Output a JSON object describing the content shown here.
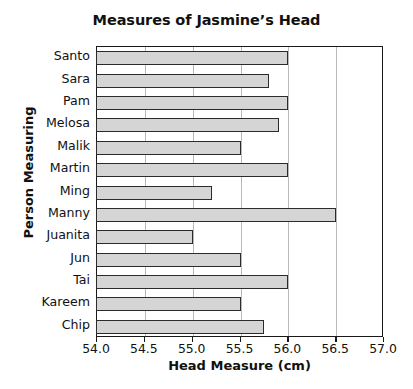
{
  "chart_data": {
    "type": "bar",
    "orientation": "horizontal",
    "title": "Measures of Jasmine’s Head",
    "xlabel": "Head Measure (cm)",
    "ylabel": "Person Measuring",
    "categories": [
      "Santo",
      "Sara",
      "Pam",
      "Melosa",
      "Malik",
      "Martin",
      "Ming",
      "Manny",
      "Juanita",
      "Jun",
      "Tai",
      "Kareem",
      "Chip"
    ],
    "values": [
      56.0,
      55.8,
      56.0,
      55.9,
      55.5,
      56.0,
      55.2,
      56.5,
      55.0,
      55.5,
      56.0,
      55.5,
      55.75
    ],
    "xlim": [
      54.0,
      57.0
    ],
    "xticks": [
      "54.0",
      "54.5",
      "55.0",
      "55.5",
      "56.0",
      "56.5",
      "57.0"
    ],
    "xtick_values": [
      54.0,
      54.5,
      55.0,
      55.5,
      56.0,
      56.5,
      57.0
    ],
    "grid": "vertical",
    "legend": "none",
    "bar_fill_color": "#d5d5d5",
    "bar_border_color": "#2b2b2b",
    "gridline_color": "#b9b9b9",
    "axis_color": "#1a1a1a"
  }
}
